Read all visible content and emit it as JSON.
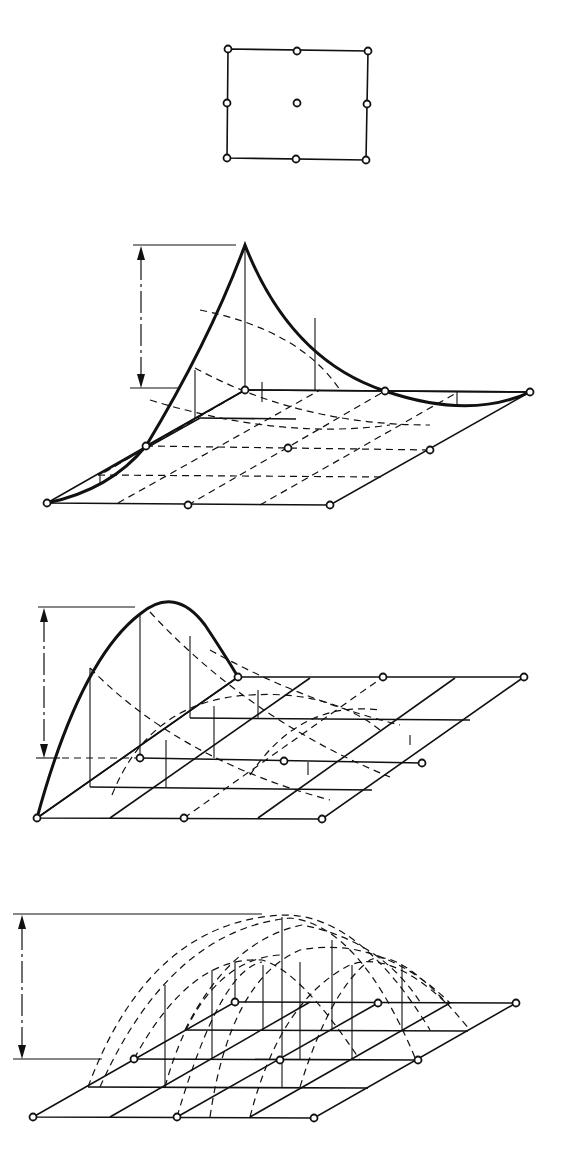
{
  "figure": {
    "description": "Nine-node quadrilateral element and its shape functions plotted as surfaces over the element",
    "panels": [
      {
        "id": "element",
        "label": "9-node element (plan view)",
        "nodes": 9
      },
      {
        "id": "corner-shape-function",
        "label": "Corner node shape function",
        "dimension_label": "1"
      },
      {
        "id": "midside-shape-function",
        "label": "Mid-side node shape function",
        "dimension_label": "1"
      },
      {
        "id": "center-shape-function",
        "label": "Center node shape function",
        "dimension_label": "1"
      }
    ]
  },
  "colors": {
    "ink": "#111111",
    "background": "#ffffff"
  }
}
